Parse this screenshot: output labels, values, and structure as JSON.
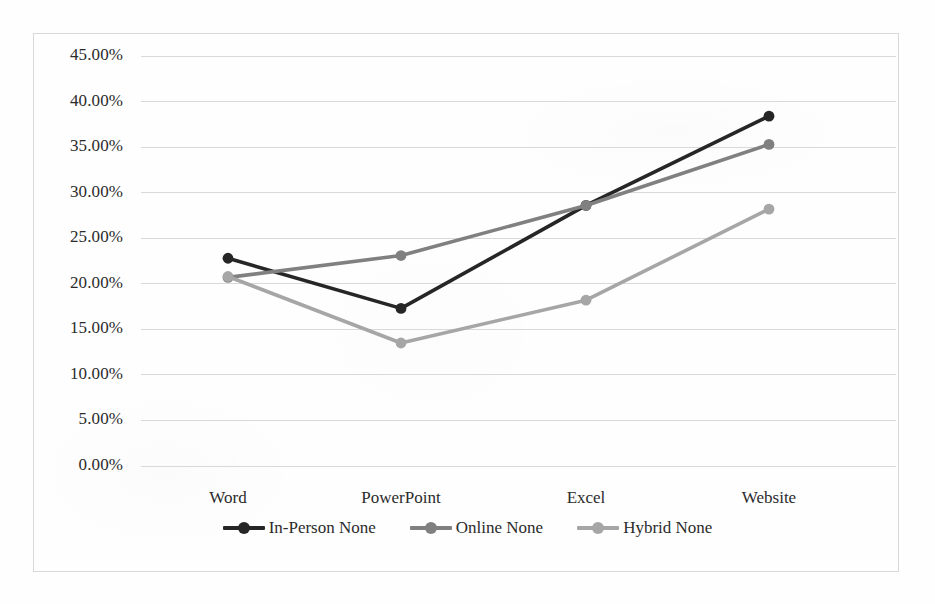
{
  "chart_data": {
    "type": "line",
    "title": "",
    "subtitle": "",
    "xlabel": "",
    "ylabel": "",
    "categories": [
      "Word",
      "PowerPoint",
      "Excel",
      "Website"
    ],
    "series": [
      {
        "name": "In-Person None",
        "color": "#262626",
        "values": [
          22.8,
          17.3,
          28.6,
          38.4
        ]
      },
      {
        "name": "Online None",
        "color": "#808080",
        "values": [
          20.7,
          23.1,
          28.6,
          35.3
        ]
      },
      {
        "name": "Hybrid None",
        "color": "#a6a6a6",
        "values": [
          20.8,
          13.5,
          18.2,
          28.2
        ]
      }
    ],
    "ylim": [
      0,
      45
    ],
    "ytick_values": [
      0,
      5,
      10,
      15,
      20,
      25,
      30,
      35,
      40,
      45
    ],
    "ytick_labels": [
      "0.00%",
      "5.00%",
      "10.00%",
      "15.00%",
      "20.00%",
      "25.00%",
      "30.00%",
      "35.00%",
      "40.00%",
      "45.00%"
    ],
    "grid": true,
    "grid_color": "#d9d9d9",
    "legend_position": "bottom",
    "markers": "circle",
    "value_suffix": "%"
  },
  "legend": {
    "entries": [
      {
        "label": "In-Person None"
      },
      {
        "label": "Online None"
      },
      {
        "label": "Hybrid None"
      }
    ]
  },
  "frame": {
    "border_color": "#d9d9d9"
  }
}
